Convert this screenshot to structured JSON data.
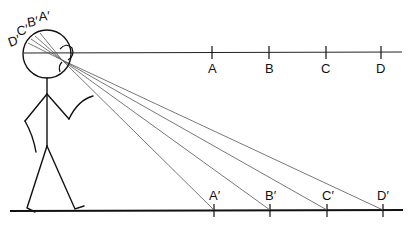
{
  "diagram": {
    "sight_line_points": [
      {
        "label": "A",
        "x": 212
      },
      {
        "label": "B",
        "x": 269
      },
      {
        "label": "C",
        "x": 326
      },
      {
        "label": "D",
        "x": 381
      }
    ],
    "ground_points": [
      {
        "label": "A′",
        "x": 214
      },
      {
        "label": "B′",
        "x": 270
      },
      {
        "label": "C′",
        "x": 327
      },
      {
        "label": "D′",
        "x": 383
      }
    ],
    "retina_labels": [
      "D′",
      "C′",
      "B′",
      "A′"
    ],
    "colors": {
      "ink": "#111111",
      "ray": "#555555",
      "background": "#ffffff"
    }
  }
}
